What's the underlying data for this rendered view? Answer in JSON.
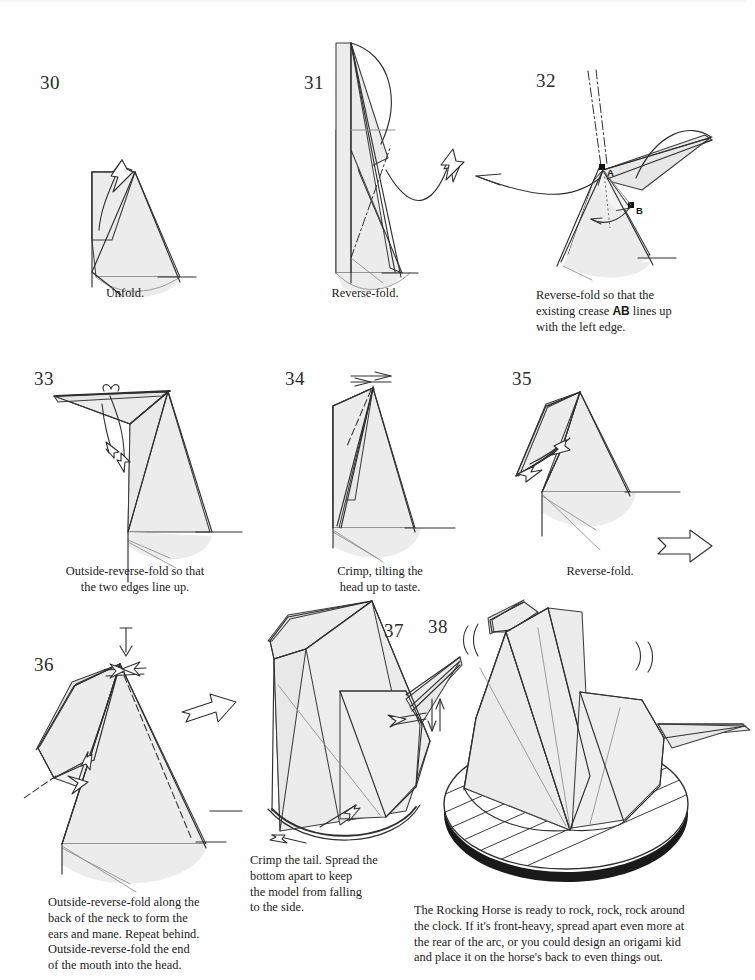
{
  "document": {
    "title": "Rocking Horse origami diagrams",
    "model_name": "Rocking Horse",
    "page_background": "#ffffff",
    "paper_fill": "#ececec",
    "line_color": "#2f2f2f"
  },
  "steps": [
    {
      "number": "30",
      "caption": "Unfold.",
      "caption_align": "center",
      "point_labels": [],
      "icons": [
        "unfold-arrow-icon"
      ]
    },
    {
      "number": "31",
      "caption": "Reverse-fold.",
      "caption_align": "center",
      "point_labels": [],
      "icons": [
        "reverse-fold-arrow-icon",
        "valley-crease-icon"
      ]
    },
    {
      "number": "32",
      "caption_lines": [
        "Reverse-fold so that the",
        "existing crease AB lines up",
        "with the left edge."
      ],
      "caption_bold_token": "AB",
      "caption_align": "left",
      "point_labels": [
        "A",
        "B"
      ],
      "icons": [
        "reverse-fold-arrow-icon",
        "crease-dashdot-icon",
        "point-marker-icon"
      ]
    },
    {
      "number": "33",
      "caption_lines": [
        "Outside-reverse-fold so that",
        "the two edges line up."
      ],
      "caption_align": "center",
      "point_labels": [],
      "icons": [
        "outside-reverse-fold-arrow-icon",
        "loop-arrow-icon",
        "valley-crease-icon"
      ]
    },
    {
      "number": "34",
      "caption_lines": [
        "Crimp, tilting the",
        "head up to taste."
      ],
      "caption_align": "center",
      "point_labels": [],
      "icons": [
        "crimp-arrow-icon",
        "valley-crease-icon"
      ]
    },
    {
      "number": "35",
      "caption": "Reverse-fold.",
      "caption_align": "center",
      "point_labels": [],
      "icons": [
        "reverse-fold-arrow-icon",
        "turn-over-arrow-icon"
      ]
    },
    {
      "number": "36",
      "caption_lines": [
        "Outside-reverse-fold along the",
        "back of the neck to form the",
        "ears and mane.  Repeat behind.",
        "Outside-reverse-fold the end",
        "of the mouth into the head."
      ],
      "caption_align": "left",
      "point_labels": [],
      "icons": [
        "push-arrow-icon",
        "outside-reverse-fold-arrow-icon",
        "valley-crease-icon",
        "next-step-arrow-icon"
      ]
    },
    {
      "number": "37",
      "caption_lines": [
        "Crimp the tail.  Spread the",
        "bottom apart to keep",
        "the model from falling",
        "to the side."
      ],
      "caption_align": "left",
      "point_labels": [],
      "icons": [
        "crimp-arrow-icon",
        "spread-arrow-icon"
      ]
    },
    {
      "number": "38",
      "caption_lines": [
        "The Rocking Horse is ready to rock, rock, rock around",
        "the clock.  If it's front-heavy, spread apart even more at",
        "the rear of the arc, or you could design an origami kid",
        "and place it on the horse's back to even things out."
      ],
      "caption_align": "left",
      "point_labels": [],
      "icons": [
        "rocking-motion-icon",
        "hatched-ground-icon"
      ]
    }
  ]
}
